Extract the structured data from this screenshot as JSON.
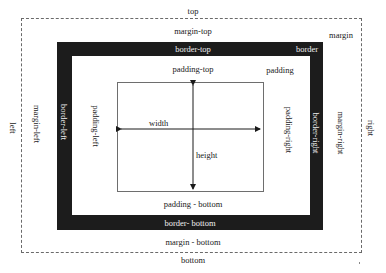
{
  "diagram": {
    "type": "css-box-model",
    "margin": {
      "area_label": "margin",
      "top": "top",
      "bottom": "bottom",
      "left": "left",
      "right": "right",
      "margin_top": "margin-top",
      "margin_bottom": "margin - bottom",
      "margin_left": "margin-left",
      "margin_right": "margin-right"
    },
    "border": {
      "area_label": "border",
      "border_top": "border-top",
      "border_bottom": "border- bottom",
      "border_left": "border-left",
      "border_right": "border-right"
    },
    "padding": {
      "area_label": "padding",
      "padding_top": "padding-top",
      "padding_bottom": "padding - bottom",
      "padding_left": "padding-left",
      "padding_right": "padding-right"
    },
    "content": {
      "width_label": "width",
      "height_label": "height"
    },
    "colors": {
      "border_fill": "#1c1c1c",
      "margin_dash": "#6a6a6a",
      "content_outline": "#6e6e6e",
      "background": "#ffffff"
    }
  }
}
